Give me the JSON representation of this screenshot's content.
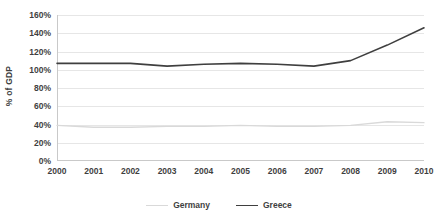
{
  "chart_data": {
    "type": "line",
    "title": "",
    "xlabel": "",
    "ylabel": "% of GDP",
    "categories": [
      "2000",
      "2001",
      "2002",
      "2003",
      "2004",
      "2005",
      "2006",
      "2007",
      "2008",
      "2009",
      "2010"
    ],
    "x": [
      2000,
      2001,
      2002,
      2003,
      2004,
      2005,
      2006,
      2007,
      2008,
      2009,
      2010
    ],
    "series": [
      {
        "name": "Germany",
        "color": "#d9d9d9",
        "values": [
          39,
          37,
          37,
          38,
          38,
          39,
          38,
          38,
          39,
          43,
          42
        ]
      },
      {
        "name": "Greece",
        "color": "#3f3f3f",
        "values": [
          107,
          107,
          107,
          104,
          106,
          107,
          106,
          104,
          110,
          127,
          146
        ]
      }
    ],
    "ylim": [
      0,
      160
    ],
    "ytick_values": [
      160,
      140,
      120,
      100,
      80,
      60,
      40,
      20,
      0
    ],
    "ytick_labels": [
      "160%",
      "140%",
      "120%",
      "100%",
      "80%",
      "60%",
      "40%",
      "20%",
      "0%"
    ],
    "grid": true,
    "grid_axis": "y",
    "legend_position": "bottom",
    "legend_entries": [
      "Germany",
      "Greece"
    ]
  },
  "axes": {
    "y_title": "% of GDP"
  }
}
